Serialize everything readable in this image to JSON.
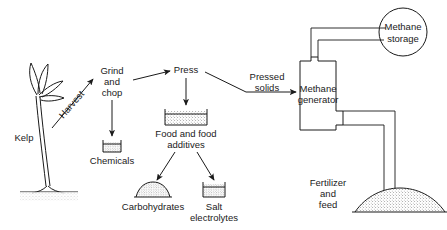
{
  "diagram": {
    "background_color": "#ffffff",
    "line_color": "#1a1a1a",
    "nodes": {
      "kelp": {
        "label": "Kelp",
        "icon": "kelp-plant-icon"
      },
      "harvest": {
        "label": "Harvest",
        "type": "arrow-label"
      },
      "grind_and_chop": {
        "label_line1": "Grind",
        "label_line2": "and",
        "label_line3": "chop"
      },
      "press": {
        "label": "Press"
      },
      "chemicals": {
        "label": "Chemicals",
        "icon": "beaker-container-icon"
      },
      "food_and_food_additives": {
        "label_line1": "Food and food",
        "label_line2": "additives",
        "icon": "tray-container-icon"
      },
      "carbohydrates": {
        "label": "Carbohydrates",
        "icon": "mound-icon"
      },
      "salt_electrolytes": {
        "label_line1": "Salt",
        "label_line2": "electrolytes",
        "icon": "beaker-container-icon"
      },
      "pressed_solids": {
        "label_line1": "Pressed",
        "label_line2": "solids",
        "type": "arrow-label"
      },
      "methane_generator": {
        "label_line1": "Methane",
        "label_line2": "generator",
        "shape": "rectangle-with-ports"
      },
      "methane_storage": {
        "label_line1": "Methane",
        "label_line2": "storage",
        "shape": "circle"
      },
      "fertilizer_and_feed": {
        "label_line1": "Fertilizer",
        "label_line2": "and",
        "label_line3": "feed",
        "icon": "mound-pile-icon"
      }
    },
    "flows": [
      {
        "from": "kelp",
        "to": "grind_and_chop",
        "label": "Harvest"
      },
      {
        "from": "grind_and_chop",
        "to": "press",
        "label": ""
      },
      {
        "from": "grind_and_chop",
        "to": "chemicals",
        "label": ""
      },
      {
        "from": "press",
        "to": "food_and_food_additives",
        "label": ""
      },
      {
        "from": "press",
        "to": "methane_generator",
        "label": "Pressed solids"
      },
      {
        "from": "food_and_food_additives",
        "to": "carbohydrates",
        "label": ""
      },
      {
        "from": "food_and_food_additives",
        "to": "salt_electrolytes",
        "label": ""
      },
      {
        "from": "methane_generator",
        "to": "methane_storage",
        "label": ""
      },
      {
        "from": "methane_generator",
        "to": "fertilizer_and_feed",
        "label": ""
      }
    ]
  }
}
